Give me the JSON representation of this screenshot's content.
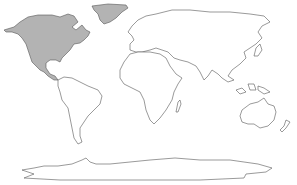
{
  "map": {
    "type": "world-outline",
    "projection": "equirectangular-like",
    "background": "#ffffff",
    "outline_color": "#555555",
    "highlight_color": "#b3b3b3",
    "unhighlighted_fill": "#ffffff",
    "regions": [
      {
        "name": "North America",
        "highlighted": true
      },
      {
        "name": "Greenland",
        "highlighted": true
      },
      {
        "name": "South America",
        "highlighted": false
      },
      {
        "name": "Europe",
        "highlighted": false
      },
      {
        "name": "Africa",
        "highlighted": false
      },
      {
        "name": "Asia",
        "highlighted": false
      },
      {
        "name": "Australia",
        "highlighted": false
      },
      {
        "name": "New Zealand",
        "highlighted": false
      },
      {
        "name": "Madagascar",
        "highlighted": false
      },
      {
        "name": "Antarctica",
        "highlighted": false
      }
    ]
  }
}
